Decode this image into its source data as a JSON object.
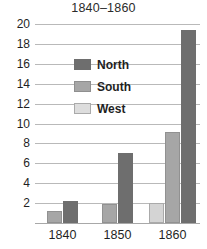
{
  "chart_data": {
    "type": "bar",
    "title": "1840–1860",
    "xlabel": "",
    "ylabel": "",
    "categories": [
      "1840",
      "1850",
      "1860"
    ],
    "series": [
      {
        "name": "North",
        "color": "#6e6e6e",
        "values": [
          2.2,
          7.0,
          19.4
        ]
      },
      {
        "name": "South",
        "color": "#a6a6a6",
        "values": [
          1.2,
          1.9,
          9.1
        ]
      },
      {
        "name": "West",
        "color": "#d4d4d4",
        "values": [
          null,
          null,
          2.0
        ]
      }
    ],
    "series_draw_order": [
      "West",
      "South",
      "North"
    ],
    "ylim": [
      0,
      20
    ],
    "ytick_labels": [
      "20",
      "18",
      "16",
      "14",
      "12",
      "10",
      "8",
      "6",
      "4",
      "2"
    ],
    "ytick_values": [
      20,
      18,
      16,
      14,
      12,
      10,
      8,
      6,
      4,
      2
    ],
    "gridlines": true,
    "grid_color": "#b9b9b9",
    "legend_position": "center",
    "legend": [
      {
        "label": "North",
        "color": "#6e6e6e"
      },
      {
        "label": "South",
        "color": "#a6a6a6"
      },
      {
        "label": "West",
        "color": "#dddddd"
      }
    ]
  }
}
